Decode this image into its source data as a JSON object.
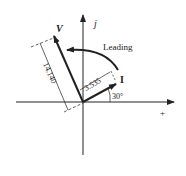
{
  "diagram": {
    "type": "phasor",
    "axes": {
      "horizontal_label": "+",
      "vertical_label": "j"
    },
    "vectors": [
      {
        "name": "V",
        "label": "V",
        "magnitude_label": "14.140"
      },
      {
        "name": "I",
        "label": "I",
        "magnitude_label": "3.535",
        "angle_label": "30°"
      }
    ],
    "annotation": "Leading",
    "colors": {
      "ink": "#222222",
      "background": "#ffffff"
    }
  }
}
